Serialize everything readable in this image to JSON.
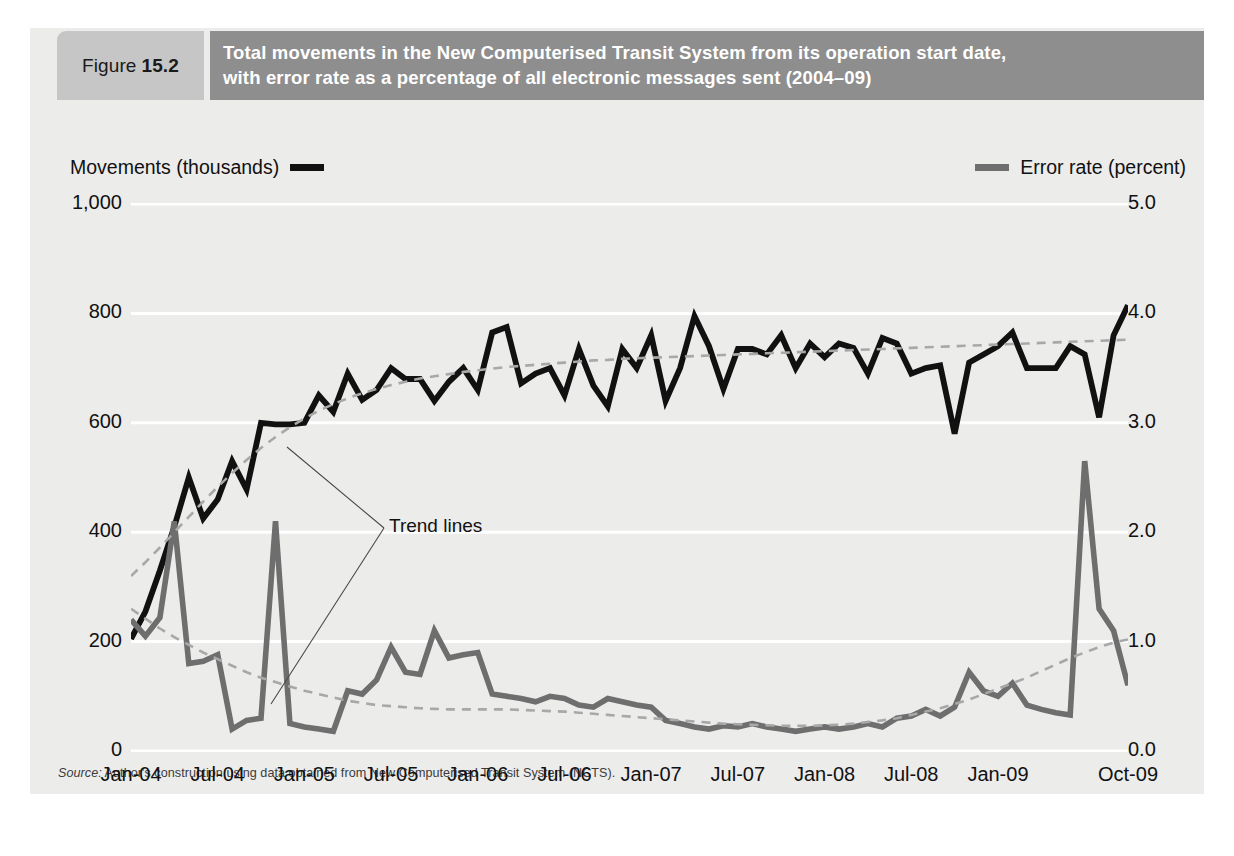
{
  "figure": {
    "tag_word": "Figure",
    "tag_number": "15.2",
    "title_line1": "Total movements in the New Computerised Transit System from its operation start date,",
    "title_line2": "with error rate as a percentage of all electronic messages sent (2004–09)",
    "source_label": "Source:",
    "source_text": " Author's construction using data obtained from New Computerised Transit System (NCTS).",
    "annotation": "Trend lines"
  },
  "colors": {
    "panel_bg": "#ececeb",
    "tag_bg": "#c6c6c6",
    "title_bg": "#8e8e8e",
    "movements_line": "#111111",
    "error_line": "#6e6e6e",
    "trend_line": "#a8a8a8",
    "gridline": "#ffffff"
  },
  "legend": {
    "left_label": "Movements (thousands)",
    "right_label": "Error rate (percent)"
  },
  "chart_data": {
    "type": "line",
    "title": "Total movements in the New Computerised Transit System from its operation start date, with error rate as a percentage of all electronic messages sent (2004–09)",
    "xlabel": "",
    "ylabel": "Movements (thousands)",
    "y2label": "Error rate (percent)",
    "ylim": [
      0,
      1000
    ],
    "y2lim": [
      0.0,
      5.0
    ],
    "yticks": [
      "0",
      "200",
      "400",
      "600",
      "800",
      "1,000"
    ],
    "ytick_values": [
      0,
      200,
      400,
      600,
      800,
      1000
    ],
    "y2ticks": [
      "0.0",
      "1.0",
      "2.0",
      "3.0",
      "4.0",
      "5.0"
    ],
    "y2tick_values": [
      0.0,
      1.0,
      2.0,
      3.0,
      4.0,
      5.0
    ],
    "xticks": [
      "Jan-04",
      "Jul-04",
      "Jan-05",
      "Jul-05",
      "Jan-06",
      "Jul-06",
      "Jan-07",
      "Jul-07",
      "Jan-08",
      "Jul-08",
      "Jan-09",
      "Oct-09"
    ],
    "xtick_indices": [
      0,
      6,
      12,
      18,
      24,
      30,
      36,
      42,
      48,
      54,
      60,
      69
    ],
    "grid": "horizontal",
    "legend_position": "top",
    "n_points": 70,
    "x": [
      "Jan-04",
      "Feb-04",
      "Mar-04",
      "Apr-04",
      "May-04",
      "Jun-04",
      "Jul-04",
      "Aug-04",
      "Sep-04",
      "Oct-04",
      "Nov-04",
      "Dec-04",
      "Jan-05",
      "Feb-05",
      "Mar-05",
      "Apr-05",
      "May-05",
      "Jun-05",
      "Jul-05",
      "Aug-05",
      "Sep-05",
      "Oct-05",
      "Nov-05",
      "Dec-05",
      "Jan-06",
      "Feb-06",
      "Mar-06",
      "Apr-06",
      "May-06",
      "Jun-06",
      "Jul-06",
      "Aug-06",
      "Sep-06",
      "Oct-06",
      "Nov-06",
      "Dec-06",
      "Jan-07",
      "Feb-07",
      "Mar-07",
      "Apr-07",
      "May-07",
      "Jun-07",
      "Jul-07",
      "Aug-07",
      "Sep-07",
      "Oct-07",
      "Nov-07",
      "Dec-07",
      "Jan-08",
      "Feb-08",
      "Mar-08",
      "Apr-08",
      "May-08",
      "Jun-08",
      "Jul-08",
      "Aug-08",
      "Sep-08",
      "Oct-08",
      "Nov-08",
      "Dec-08",
      "Jan-09",
      "Feb-09",
      "Mar-09",
      "Apr-09",
      "May-09",
      "Jun-09",
      "Jul-09",
      "Aug-09",
      "Sep-09",
      "Oct-09"
    ],
    "series": [
      {
        "name": "Movements (thousands)",
        "axis": "left",
        "color": "#111111",
        "style": "solid",
        "values": [
          205,
          255,
          330,
          410,
          500,
          425,
          460,
          530,
          478,
          600,
          597,
          597,
          600,
          650,
          620,
          690,
          642,
          660,
          700,
          680,
          680,
          640,
          675,
          700,
          660,
          765,
          775,
          672,
          690,
          700,
          650,
          735,
          668,
          630,
          735,
          700,
          760,
          640,
          700,
          795,
          740,
          662,
          735,
          735,
          725,
          760,
          700,
          745,
          720,
          745,
          737,
          690,
          755,
          745,
          690,
          700,
          705,
          580,
          710,
          725,
          740,
          765,
          700,
          700,
          700,
          740,
          725,
          610,
          760,
          815
        ]
      },
      {
        "name": "Error rate (percent)",
        "axis": "right",
        "color": "#6e6e6e",
        "style": "solid",
        "values": [
          1.2,
          1.05,
          1.22,
          2.1,
          0.8,
          0.82,
          0.88,
          0.2,
          0.28,
          0.3,
          2.1,
          0.25,
          0.22,
          0.2,
          0.18,
          0.55,
          0.52,
          0.65,
          0.95,
          0.72,
          0.7,
          1.1,
          0.85,
          0.88,
          0.9,
          0.52,
          0.5,
          0.48,
          0.45,
          0.5,
          0.48,
          0.42,
          0.4,
          0.48,
          0.45,
          0.42,
          0.4,
          0.28,
          0.25,
          0.22,
          0.2,
          0.23,
          0.22,
          0.25,
          0.22,
          0.2,
          0.18,
          0.2,
          0.22,
          0.2,
          0.22,
          0.25,
          0.22,
          0.3,
          0.32,
          0.38,
          0.32,
          0.4,
          0.72,
          0.55,
          0.5,
          0.62,
          0.42,
          0.38,
          0.35,
          0.33,
          2.65,
          1.3,
          1.1,
          0.6
        ]
      },
      {
        "name": "Trend line — movements",
        "axis": "left",
        "color": "#a8a8a8",
        "style": "dashed",
        "values": [
          320,
          345,
          372,
          400,
          428,
          456,
          483,
          508,
          532,
          554,
          574,
          592,
          608,
          622,
          634,
          645,
          654,
          662,
          669,
          675,
          681,
          685,
          689,
          693,
          696,
          699,
          702,
          704,
          706,
          708,
          710,
          712,
          714,
          715,
          717,
          718,
          719,
          720,
          721,
          722,
          723,
          724,
          725,
          726,
          727,
          728,
          729,
          730,
          731,
          732,
          733,
          734,
          735,
          736,
          737,
          738,
          739,
          740,
          741,
          742,
          743,
          744,
          745,
          746,
          747,
          748,
          749,
          750,
          751,
          752
        ]
      },
      {
        "name": "Trend line — error rate",
        "axis": "right",
        "color": "#a8a8a8",
        "style": "dashed",
        "values": [
          1.3,
          1.21,
          1.12,
          1.04,
          0.97,
          0.9,
          0.84,
          0.78,
          0.72,
          0.67,
          0.63,
          0.59,
          0.55,
          0.52,
          0.49,
          0.46,
          0.44,
          0.42,
          0.41,
          0.4,
          0.39,
          0.385,
          0.38,
          0.38,
          0.38,
          0.38,
          0.38,
          0.375,
          0.37,
          0.365,
          0.36,
          0.35,
          0.34,
          0.33,
          0.32,
          0.31,
          0.3,
          0.29,
          0.28,
          0.27,
          0.26,
          0.25,
          0.245,
          0.24,
          0.235,
          0.23,
          0.23,
          0.23,
          0.235,
          0.24,
          0.25,
          0.265,
          0.28,
          0.3,
          0.33,
          0.36,
          0.39,
          0.43,
          0.47,
          0.52,
          0.57,
          0.62,
          0.67,
          0.73,
          0.79,
          0.85,
          0.9,
          0.95,
          0.99,
          1.02
        ]
      }
    ]
  }
}
